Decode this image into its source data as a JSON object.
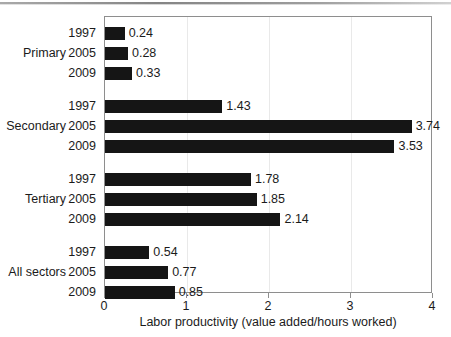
{
  "chart_data": {
    "type": "bar",
    "orientation": "horizontal",
    "title": "",
    "xlabel": "Labor productivity (value added/hours worked)",
    "ylabel": "",
    "xlim": [
      0,
      4
    ],
    "xticks": [
      "0",
      "1",
      "2",
      "3",
      "4"
    ],
    "grid": false,
    "legend": "none",
    "bar_color": "#151515",
    "groups": [
      {
        "label": "Primary",
        "items": [
          {
            "category": "1997",
            "value": 0.24,
            "value_label": "0.24"
          },
          {
            "category": "2005",
            "value": 0.28,
            "value_label": "0.28"
          },
          {
            "category": "2009",
            "value": 0.33,
            "value_label": "0.33"
          }
        ]
      },
      {
        "label": "Secondary",
        "items": [
          {
            "category": "1997",
            "value": 1.43,
            "value_label": "1.43"
          },
          {
            "category": "2005",
            "value": 3.74,
            "value_label": "3.74"
          },
          {
            "category": "2009",
            "value": 3.53,
            "value_label": "3.53"
          }
        ]
      },
      {
        "label": "Tertiary",
        "items": [
          {
            "category": "1997",
            "value": 1.78,
            "value_label": "1.78"
          },
          {
            "category": "2005",
            "value": 1.85,
            "value_label": "1.85"
          },
          {
            "category": "2009",
            "value": 2.14,
            "value_label": "2.14"
          }
        ]
      },
      {
        "label": "All sectors",
        "items": [
          {
            "category": "1997",
            "value": 0.54,
            "value_label": "0.54"
          },
          {
            "category": "2005",
            "value": 0.77,
            "value_label": "0.77"
          },
          {
            "category": "2009",
            "value": 0.85,
            "value_label": "0.85"
          }
        ]
      }
    ]
  }
}
